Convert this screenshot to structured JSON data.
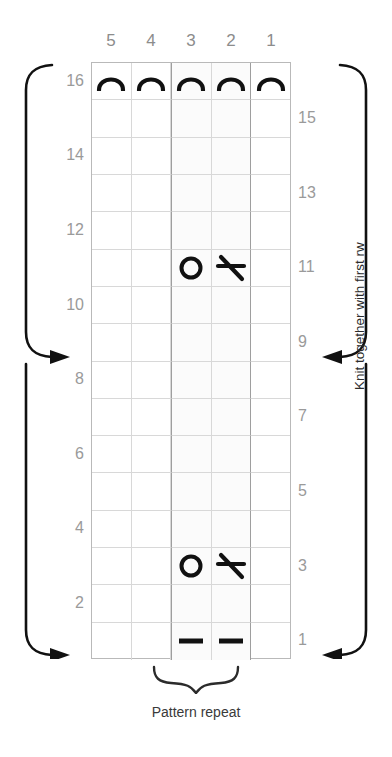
{
  "chart_data": {
    "type": "table",
    "columns": 5,
    "rows": 16,
    "column_headers": [
      "5",
      "4",
      "3",
      "2",
      "1"
    ],
    "row_labels_left": [
      "16",
      "",
      "14",
      "",
      "12",
      "",
      "10",
      "",
      "8",
      "",
      "6",
      "",
      "4",
      "",
      "2",
      ""
    ],
    "row_labels_right": [
      "",
      "15",
      "",
      "13",
      "",
      "11",
      "",
      "9",
      "",
      "7",
      "",
      "5",
      "",
      "3",
      "",
      "1"
    ],
    "repeat_columns": [
      3,
      2
    ],
    "legend": {
      "arch": "bind-off / cast-off stitch",
      "circle": "yarn over",
      "slash": "knit two together",
      "dash": "purl stitch"
    },
    "cells": [
      {
        "row": 16,
        "col": 5,
        "symbol": "arch"
      },
      {
        "row": 16,
        "col": 4,
        "symbol": "arch"
      },
      {
        "row": 16,
        "col": 3,
        "symbol": "arch"
      },
      {
        "row": 16,
        "col": 2,
        "symbol": "arch"
      },
      {
        "row": 16,
        "col": 1,
        "symbol": "arch"
      },
      {
        "row": 11,
        "col": 3,
        "symbol": "circle"
      },
      {
        "row": 11,
        "col": 2,
        "symbol": "slash"
      },
      {
        "row": 3,
        "col": 3,
        "symbol": "circle"
      },
      {
        "row": 3,
        "col": 2,
        "symbol": "slash"
      },
      {
        "row": 1,
        "col": 3,
        "symbol": "dash"
      },
      {
        "row": 1,
        "col": 2,
        "symbol": "dash"
      }
    ],
    "arrow_rows_left": [
      6,
      1
    ],
    "arrow_rows_right": [
      6,
      1
    ],
    "grid_color": "#d8d8d8",
    "repeat_border_color": "#9e9e9e",
    "symbol_color": "#111111",
    "label_color": "#9a9a9a"
  },
  "annotations": {
    "side_caption": "Knit together with first rw",
    "repeat_caption": "Pattern repeat"
  }
}
